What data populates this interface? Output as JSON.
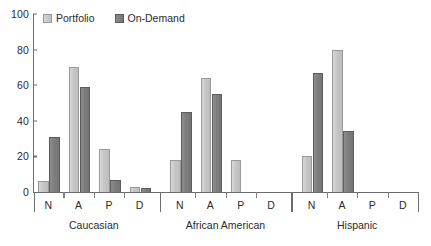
{
  "chart_data": {
    "type": "bar",
    "title": "",
    "xlabel": "",
    "ylabel": "",
    "ylim": [
      0,
      100
    ],
    "yticks": [
      0,
      20,
      40,
      60,
      80,
      100
    ],
    "grid": false,
    "legend_position": "top-left",
    "categories": [
      "N",
      "A",
      "P",
      "D"
    ],
    "groups": [
      "Caucasian",
      "African American",
      "Hispanic"
    ],
    "series": [
      {
        "name": "Portfolio",
        "color": "#c6c6c6",
        "values_by_group": {
          "Caucasian": [
            6,
            70,
            24,
            3
          ],
          "African American": [
            18,
            64,
            18,
            0
          ],
          "Hispanic": [
            20,
            80,
            0,
            0
          ]
        }
      },
      {
        "name": "On-Demand",
        "color": "#7e7e7e",
        "values_by_group": {
          "Caucasian": [
            31,
            59,
            7,
            2
          ],
          "African American": [
            45,
            55,
            0,
            0
          ],
          "Hispanic": [
            67,
            34,
            0,
            0
          ]
        }
      }
    ]
  },
  "legend": {
    "items": [
      {
        "label": "Portfolio",
        "swatch": "portfolio"
      },
      {
        "label": "On-Demand",
        "swatch": "ondemand"
      }
    ]
  },
  "yaxis": {
    "ticks": [
      "0",
      "20",
      "40",
      "60",
      "80",
      "100"
    ]
  },
  "xaxis": {
    "group_labels": [
      "Caucasian",
      "African American",
      "Hispanic"
    ],
    "category_labels": [
      "N",
      "A",
      "P",
      "D"
    ]
  }
}
